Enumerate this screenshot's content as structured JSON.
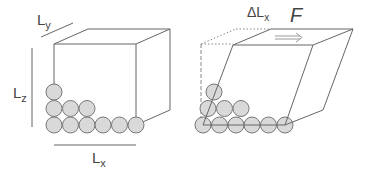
{
  "diagram": {
    "left_panel": {
      "labels": {
        "ly": "L",
        "ly_sub": "y",
        "lz": "L",
        "lz_sub": "z",
        "lx": "L",
        "lx_sub": "x"
      }
    },
    "right_panel": {
      "labels": {
        "delta_lx": "ΔL",
        "delta_lx_sub": "x",
        "force": "F"
      }
    },
    "colors": {
      "line": "#555555",
      "particle_fill": "#d8d8d8",
      "particle_stroke": "#777777",
      "text": "#444444"
    }
  }
}
